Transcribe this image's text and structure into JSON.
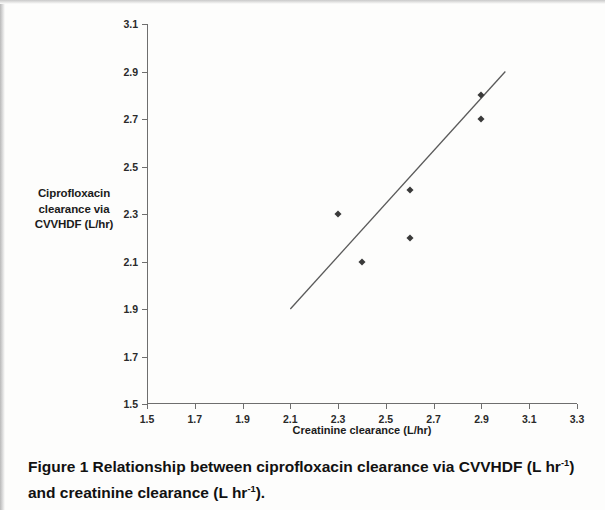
{
  "figure": {
    "caption_label": "Figure 1",
    "caption_text_1": " Relationship between ciprofloxacin clearance via CVVHDF (L hr",
    "caption_sup_1": "-1",
    "caption_text_2": ") and creatinine clearance (L hr",
    "caption_sup_2": "-1",
    "caption_text_3": ")."
  },
  "chart_data": {
    "type": "scatter",
    "title": "",
    "xlabel": "Creatinine clearance (L/hr)",
    "ylabel": "Ciprofloxacin clearance via CVVHDF (L/hr)",
    "ylabel_lines": [
      "Ciprofloxacin",
      "clearance via",
      "CVVHDF (L/hr)"
    ],
    "xlim": [
      1.5,
      3.3
    ],
    "ylim": [
      1.5,
      3.1
    ],
    "xticks": [
      1.5,
      1.7,
      1.9,
      2.1,
      2.3,
      2.5,
      2.7,
      2.9,
      3.1,
      3.3
    ],
    "yticks": [
      1.5,
      1.7,
      1.9,
      2.1,
      2.3,
      2.5,
      2.7,
      2.9,
      3.1
    ],
    "xticklabels": [
      "1.5",
      "1.7",
      "1.9",
      "2.1",
      "2.3",
      "2.5",
      "2.7",
      "2.9",
      "3.1",
      "3.3"
    ],
    "yticklabels": [
      "1.5",
      "1.7",
      "1.9",
      "2.1",
      "2.3",
      "2.5",
      "2.7",
      "2.9",
      "3.1"
    ],
    "grid": false,
    "legend": false,
    "marker": "diamond",
    "marker_color": "#3a3a3a",
    "line_color": "#5a5a5a",
    "points": [
      {
        "x": 2.3,
        "y": 2.3
      },
      {
        "x": 2.4,
        "y": 2.1
      },
      {
        "x": 2.6,
        "y": 2.4
      },
      {
        "x": 2.6,
        "y": 2.2
      },
      {
        "x": 2.9,
        "y": 2.8
      },
      {
        "x": 2.9,
        "y": 2.7
      }
    ],
    "trendline": {
      "x1": 2.1,
      "y1": 1.9,
      "x2": 3.0,
      "y2": 2.9
    }
  }
}
